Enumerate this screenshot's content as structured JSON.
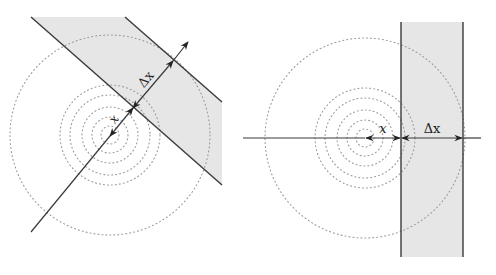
{
  "figure": {
    "left_panel": {
      "description": "Oblique slab of thickness Δx at distance x from a point source with concentric wavefronts",
      "label_distance": "x",
      "label_thickness": "Δx",
      "colors": {
        "band_fill": "#e6e6e6",
        "edge": "#3a3a3a",
        "wavefront": "#9a9a9a"
      }
    },
    "right_panel": {
      "description": "Vertical slab of thickness Δx at distance x from a point source with concentric wavefronts",
      "label_distance": "x",
      "label_thickness": "Δx",
      "colors": {
        "band_fill": "#e6e6e6",
        "edge": "#3a3a3a",
        "wavefront": "#9a9a9a"
      }
    }
  }
}
